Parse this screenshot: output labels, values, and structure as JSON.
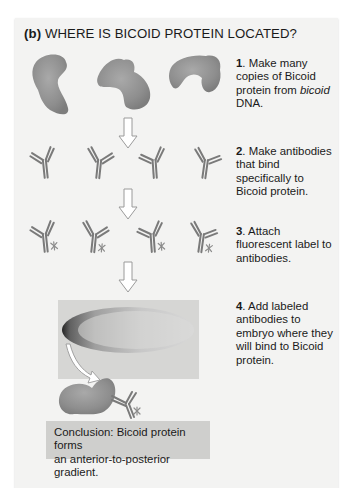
{
  "panel": {
    "label": "(b)",
    "title": "WHERE IS BICOID PROTEIN LOCATED?"
  },
  "steps": [
    {
      "number": "1",
      "text_parts": [
        "Make many copies of Bicoid protein from ",
        "bicoid",
        " DNA."
      ]
    },
    {
      "number": "2",
      "text_parts": [
        "Make antibodies that bind specifically to Bicoid protein."
      ]
    },
    {
      "number": "3",
      "text_parts": [
        "Attach fluorescent label to antibodies."
      ]
    },
    {
      "number": "4",
      "text_parts": [
        "Add labeled antibodies to embryo where they will bind to Bicoid protein."
      ]
    }
  ],
  "conclusion": {
    "line1": "Conclusion: Bicoid protein forms",
    "line2": "an anterior-to-posterior gradient."
  },
  "colors": {
    "panel_bg": "#f3f3f2",
    "protein": "#8f8f8f",
    "antibody": "#7a7a7a",
    "conclusion_bg": "#cfcfcd",
    "embryo_bg": "#d6d6d4"
  }
}
